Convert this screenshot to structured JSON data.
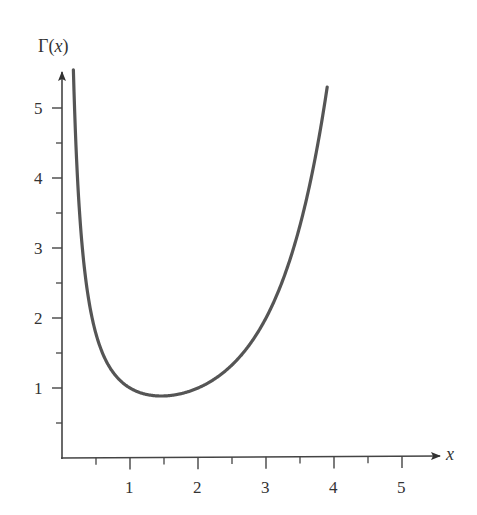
{
  "chart_data": {
    "type": "line",
    "title": "",
    "function": "Gamma",
    "xlabel": "x",
    "ylabel": "Γ(x)",
    "ylabel_parts": {
      "prefix": "Γ(",
      "var": "x",
      "suffix": ")"
    },
    "x_ticks": [
      1,
      2,
      3,
      4,
      5
    ],
    "x_minor_ticks": [
      0.5,
      1.5,
      2.5,
      3.5,
      4.5
    ],
    "y_ticks": [
      1,
      2,
      3,
      4,
      5
    ],
    "y_minor_ticks": [
      0.5,
      1.5,
      2.5,
      3.5,
      4.5
    ],
    "xlim": [
      0,
      5.5
    ],
    "ylim": [
      0,
      5.5
    ],
    "grid": false,
    "legend": null,
    "curve_domain": [
      0.12,
      3.9
    ],
    "series": [
      {
        "name": "Γ(x)",
        "x": [
          0.12,
          0.15,
          0.2,
          0.3,
          0.5,
          0.75,
          1.0,
          1.25,
          1.4616,
          1.75,
          2.0,
          2.5,
          3.0,
          3.5,
          3.9
        ],
        "values": [
          7.78,
          6.22,
          4.59,
          2.99,
          1.77,
          1.23,
          1.0,
          0.906,
          0.886,
          0.919,
          1.0,
          1.329,
          2.0,
          3.323,
          5.3
        ]
      }
    ],
    "minimum": {
      "x": 1.4616,
      "y": 0.8856
    },
    "colors": {
      "curve": "#555555",
      "axis": "#444444",
      "text": "#333333"
    }
  }
}
